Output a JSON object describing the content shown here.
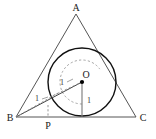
{
  "figure": {
    "kind": "geometry-diagram",
    "background_color": "#ffffff",
    "stroke_color": "#555555",
    "circle_color": "#111111",
    "dash_color": "#999999",
    "point_color": "#000000",
    "vertices": [
      {
        "name": "A",
        "label": "A",
        "x": 76,
        "y": 14,
        "label_x": 76,
        "label_y": 11
      },
      {
        "name": "B",
        "label": "B",
        "x": 16,
        "y": 117,
        "label_x": 10,
        "label_y": 121
      },
      {
        "name": "C",
        "label": "C",
        "x": 136,
        "y": 117,
        "label_x": 142,
        "label_y": 121
      }
    ],
    "points": [
      {
        "name": "O",
        "label": "O",
        "x": 82,
        "y": 82,
        "label_x": 86,
        "label_y": 77
      },
      {
        "name": "P",
        "label": "P",
        "x": 48,
        "y": 117,
        "label_x": 48,
        "label_y": 128
      }
    ],
    "circle": {
      "cx": 82,
      "cy": 82,
      "r": 34
    },
    "arc": {
      "cx": 82,
      "cy": 82,
      "r": 22
    },
    "measures": [
      {
        "name": "radius-to-AB-tangent",
        "label": "1",
        "x": 62,
        "y": 84
      },
      {
        "name": "radius-near-B",
        "label": "1",
        "x": 37,
        "y": 100
      },
      {
        "name": "radius-to-base",
        "label": "1",
        "x": 89,
        "y": 102
      }
    ]
  }
}
